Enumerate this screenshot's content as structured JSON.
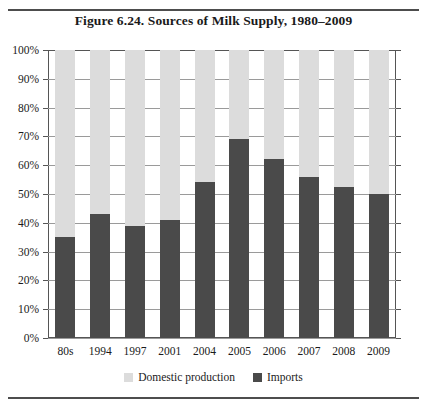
{
  "figure": {
    "title": "Figure 6.24. Sources of Milk Supply, 1980–2009"
  },
  "legend": {
    "items": [
      {
        "label": "Domestic production",
        "color": "#dcdcdc",
        "swatch": "legend-swatch-domestic"
      },
      {
        "label": "Imports",
        "color": "#4a4a4a",
        "swatch": "legend-swatch-imports"
      }
    ]
  },
  "axis": {
    "y_ticks": [
      "100%",
      "90%",
      "80%",
      "70%",
      "60%",
      "50%",
      "40%",
      "30%",
      "20%",
      "10%",
      "0%"
    ]
  },
  "chart_data": {
    "type": "bar",
    "stacked": true,
    "title": "Figure 6.24. Sources of Milk Supply, 1980–2009",
    "xlabel": "",
    "ylabel": "",
    "ylim": [
      0,
      100
    ],
    "y_unit": "%",
    "grid": true,
    "legend_position": "bottom",
    "categories": [
      "80s",
      "1994",
      "1997",
      "2001",
      "2004",
      "2005",
      "2006",
      "2007",
      "2008",
      "2009"
    ],
    "series": [
      {
        "name": "Imports",
        "color": "#4a4a4a",
        "values": [
          35,
          43,
          39,
          41,
          54,
          69,
          62,
          56,
          52.5,
          50
        ]
      },
      {
        "name": "Domestic production",
        "color": "#dcdcdc",
        "values": [
          65,
          57,
          61,
          59,
          46,
          31,
          38,
          44,
          47.5,
          50
        ]
      }
    ]
  }
}
